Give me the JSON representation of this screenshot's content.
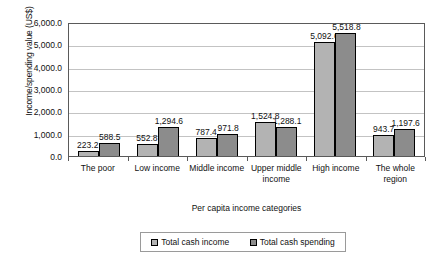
{
  "chart_data": {
    "type": "bar",
    "title": "",
    "xlabel": "Per capita income categories",
    "ylabel": "Income/spending value (US$)",
    "categories": [
      "The poor",
      "Low income",
      "Middle income",
      "Upper middle income",
      "High income",
      "The whole region"
    ],
    "series": [
      {
        "name": "Total cash income",
        "color": "#b3b3b3",
        "values": [
          223.2,
          552.8,
          787.4,
          1524.8,
          5092.6,
          943.7
        ],
        "labels": [
          "223.2",
          "552.8",
          "787.4",
          "1,524.8",
          "5,092.6",
          "943.7"
        ]
      },
      {
        "name": "Total cash spending",
        "color": "#8c8c8c",
        "values": [
          588.5,
          1294.6,
          971.8,
          1288.1,
          5518.8,
          1197.6
        ],
        "labels": [
          "588.5",
          "1,294.6",
          "971.8",
          "1,288.1",
          "5,518.8",
          "1,197.6"
        ]
      }
    ],
    "ylim": [
      0,
      6000
    ],
    "ytick_values": [
      0,
      1000,
      2000,
      3000,
      4000,
      5000,
      6000
    ],
    "ytick_labels": [
      "0.0",
      "1,000.0",
      "2,000.0",
      "3,000.0",
      "4,000.0",
      "5,000.0",
      "6,000.0"
    ],
    "grid": true,
    "legend_position": "bottom"
  },
  "legend": {
    "items": [
      {
        "label": "Total cash income"
      },
      {
        "label": "Total cash spending"
      }
    ]
  }
}
